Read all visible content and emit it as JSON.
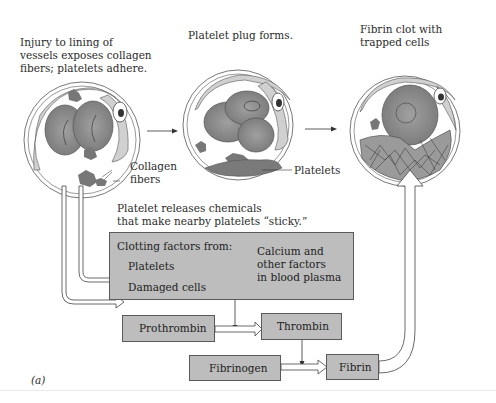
{
  "figure": {
    "panel_label": "(a)",
    "stages": [
      {
        "id": "injury",
        "caption": "Injury to lining of\nvessels exposes collagen\nfibers; platelets adhere.",
        "callout": "Collagen\nfibers"
      },
      {
        "id": "plug",
        "caption": "Platelet plug forms.",
        "callout": "Platelets"
      },
      {
        "id": "clot",
        "caption": "Fibrin clot with\ntrapped cells"
      }
    ],
    "release_note": "Platelet releases chemicals\nthat make nearby platelets “sticky.”",
    "clotting_box": {
      "title": "Clotting factors from:",
      "sources": [
        "Platelets",
        "Damaged cells"
      ],
      "plasma": "Calcium and\nother factors\nin blood plasma"
    },
    "cascade": {
      "prothrombin": "Prothrombin",
      "thrombin": "Thrombin",
      "fibrinogen": "Fibrinogen",
      "fibrin": "Fibrin"
    },
    "colors": {
      "box_fill": "#bdbdbd",
      "cell_fill": "#8c8c8c",
      "vessel_wall": "#c8c8c8"
    }
  }
}
